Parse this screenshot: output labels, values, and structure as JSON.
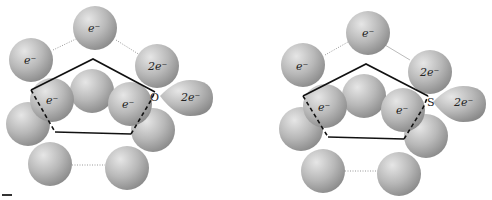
{
  "diagram": {
    "colors": {
      "sphere": "#b5b5b5",
      "ring_line": "#111111",
      "bond_dotted": "#999999"
    },
    "panels": [
      {
        "name": "furan",
        "heteroatom": "O",
        "labels": {
          "top": "e⁻",
          "upper_left": "e⁻",
          "upper_right": "2e⁻",
          "lone_pair": "2e⁻",
          "inner_left": "e⁻",
          "inner_right": "e⁻"
        }
      },
      {
        "name": "thiophene",
        "heteroatom": "S",
        "labels": {
          "top": "e⁻",
          "upper_left": "e⁻",
          "upper_right": "2e⁻",
          "lone_pair": "2e⁻",
          "inner_left": "e⁻",
          "inner_right": "e⁻"
        }
      }
    ]
  }
}
